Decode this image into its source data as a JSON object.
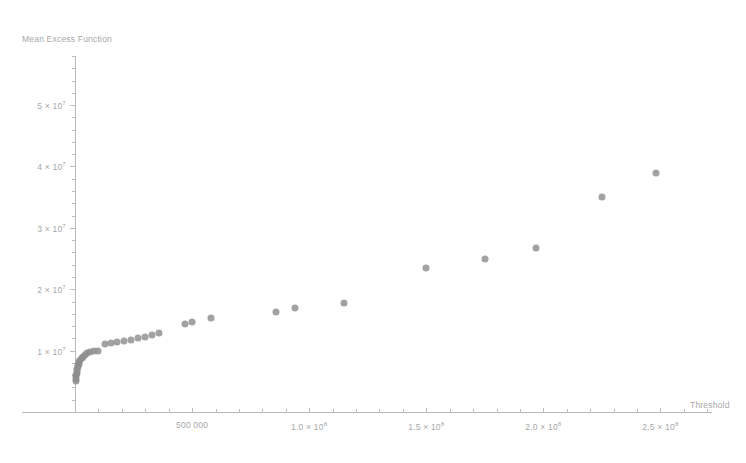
{
  "chart_data": {
    "type": "scatter",
    "title": "",
    "xlabel": "Threshold",
    "ylabel": "Mean Excess Function",
    "grid": false,
    "legend": null,
    "xlim": [
      0,
      272000000
    ],
    "ylim": [
      0,
      58000000
    ],
    "x_ticks": [
      {
        "value": 50000000,
        "label": "500 000"
      },
      {
        "value": 100000000,
        "label": "1.0 × 10⁸"
      },
      {
        "value": 150000000,
        "label": "1.5 × 10⁸"
      },
      {
        "value": 200000000,
        "label": "2.0 × 10⁸"
      },
      {
        "value": 250000000,
        "label": "2.5 × 10⁸"
      }
    ],
    "y_ticks": [
      {
        "value": 10000000,
        "label": "1 × 10⁷"
      },
      {
        "value": 20000000,
        "label": "2 × 10⁷"
      },
      {
        "value": 30000000,
        "label": "3 × 10⁷"
      },
      {
        "value": 40000000,
        "label": "4 × 10⁷"
      },
      {
        "value": 50000000,
        "label": "5 × 10⁷"
      }
    ],
    "marker": {
      "color": "#8e8e8e",
      "shape": "circle",
      "size": 7
    },
    "points": [
      {
        "x": 300000,
        "y": 5000000
      },
      {
        "x": 400000,
        "y": 5400000
      },
      {
        "x": 500000,
        "y": 5800000
      },
      {
        "x": 600000,
        "y": 6100000
      },
      {
        "x": 700000,
        "y": 6400000
      },
      {
        "x": 800000,
        "y": 6700000
      },
      {
        "x": 900000,
        "y": 7000000
      },
      {
        "x": 1100000,
        "y": 7300000
      },
      {
        "x": 1300000,
        "y": 7600000
      },
      {
        "x": 1600000,
        "y": 7900000
      },
      {
        "x": 1900000,
        "y": 8200000
      },
      {
        "x": 2300000,
        "y": 8500000
      },
      {
        "x": 2800000,
        "y": 8800000
      },
      {
        "x": 3400000,
        "y": 9000000
      },
      {
        "x": 4200000,
        "y": 9300000
      },
      {
        "x": 5200000,
        "y": 9600000
      },
      {
        "x": 6500000,
        "y": 9800000
      },
      {
        "x": 8000000,
        "y": 9900000
      },
      {
        "x": 10000000,
        "y": 10000000
      },
      {
        "x": 13000000,
        "y": 11000000
      },
      {
        "x": 15500000,
        "y": 11200000
      },
      {
        "x": 18000000,
        "y": 11400000
      },
      {
        "x": 21000000,
        "y": 11600000
      },
      {
        "x": 24000000,
        "y": 11800000
      },
      {
        "x": 27000000,
        "y": 12000000
      },
      {
        "x": 30000000,
        "y": 12300000
      },
      {
        "x": 33000000,
        "y": 12600000
      },
      {
        "x": 36000000,
        "y": 12800000
      },
      {
        "x": 47000000,
        "y": 14300000
      },
      {
        "x": 50000000,
        "y": 14600000
      },
      {
        "x": 58000000,
        "y": 15300000
      },
      {
        "x": 86000000,
        "y": 16300000
      },
      {
        "x": 94000000,
        "y": 17000000
      },
      {
        "x": 115000000,
        "y": 17800000
      },
      {
        "x": 150000000,
        "y": 23500000
      },
      {
        "x": 175000000,
        "y": 25000000
      },
      {
        "x": 197000000,
        "y": 26700000
      },
      {
        "x": 225000000,
        "y": 35000000
      },
      {
        "x": 248000000,
        "y": 39000000
      }
    ]
  }
}
